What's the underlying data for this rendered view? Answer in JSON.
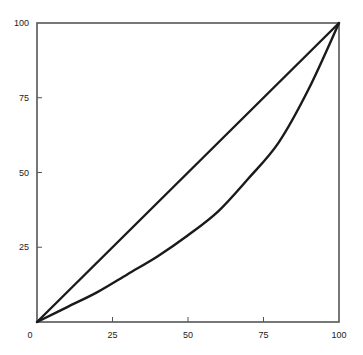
{
  "chart_data": {
    "type": "line",
    "title": "",
    "xlabel": "",
    "ylabel": "",
    "xlim": [
      0,
      100
    ],
    "ylim": [
      0,
      100
    ],
    "grid": false,
    "legend": null,
    "x_ticks": [
      "0",
      "25",
      "50",
      "75",
      "100"
    ],
    "y_ticks": [
      "0",
      "25",
      "50",
      "75",
      "100"
    ],
    "series": [
      {
        "name": "line of equality",
        "x": [
          0,
          100
        ],
        "values": [
          0,
          100
        ]
      },
      {
        "name": "Lorenz curve",
        "x": [
          0,
          10,
          20,
          30,
          40,
          50,
          60,
          70,
          80,
          90,
          100
        ],
        "values": [
          0,
          5,
          10,
          16,
          22,
          29,
          37,
          48,
          60,
          78,
          100
        ]
      }
    ]
  },
  "colors": {
    "axis": "#555555",
    "line": "#1a1a1a",
    "background": "#ffffff"
  }
}
